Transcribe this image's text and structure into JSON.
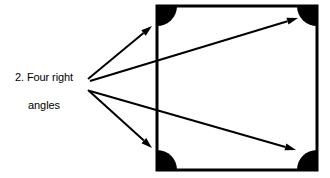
{
  "figure": {
    "width": 330,
    "height": 178,
    "background_color": "#ffffff",
    "stroke_color": "#000000",
    "fill_color": "#000000"
  },
  "annotation": {
    "full_text": "2. Four right angles",
    "line_1": "2. Four right",
    "line_2": "angles",
    "number": "2.",
    "align": "center",
    "font_size_px": 11,
    "color": "#000000"
  },
  "shape": {
    "name": "square",
    "description": "Square with four right angles",
    "x": 157,
    "y": 6,
    "width": 160,
    "height": 164,
    "stroke_width": 3,
    "stroke_color": "#000000",
    "fill": "none"
  },
  "corner_markers": {
    "count": 4,
    "style": "filled-quarter-disc",
    "radius": 20,
    "fill_color": "#000000",
    "items": [
      {
        "name": "top-left",
        "cx": 158,
        "cy": 7,
        "start_deg": 0,
        "sweep_deg": 90
      },
      {
        "name": "top-right",
        "cx": 316,
        "cy": 7,
        "start_deg": 90,
        "sweep_deg": 180
      },
      {
        "name": "bottom-left",
        "cx": 158,
        "cy": 169,
        "start_deg": 270,
        "sweep_deg": 360
      },
      {
        "name": "bottom-right",
        "cx": 316,
        "cy": 169,
        "start_deg": 180,
        "sweep_deg": 270
      }
    ]
  },
  "arrows": {
    "count": 4,
    "stroke_color": "#000000",
    "stroke_width": 2,
    "head_length": 11,
    "head_width": 7,
    "origins": [
      {
        "name": "upper-origin",
        "x": 87,
        "y": 80
      },
      {
        "name": "lower-origin",
        "x": 87,
        "y": 89
      }
    ],
    "items": [
      {
        "name": "arrow-to-top-left-corner",
        "from_x": 88,
        "from_y": 79,
        "to_x": 152,
        "to_y": 26,
        "target": "top-left"
      },
      {
        "name": "arrow-to-top-right-corner",
        "from_x": 90,
        "from_y": 81,
        "to_x": 298,
        "to_y": 18,
        "target": "top-right"
      },
      {
        "name": "arrow-to-bottom-left-corner",
        "from_x": 88,
        "from_y": 90,
        "to_x": 152,
        "to_y": 148,
        "target": "bottom-left"
      },
      {
        "name": "arrow-to-bottom-right-corner",
        "from_x": 90,
        "from_y": 91,
        "to_x": 296,
        "to_y": 150,
        "target": "bottom-right"
      }
    ]
  }
}
